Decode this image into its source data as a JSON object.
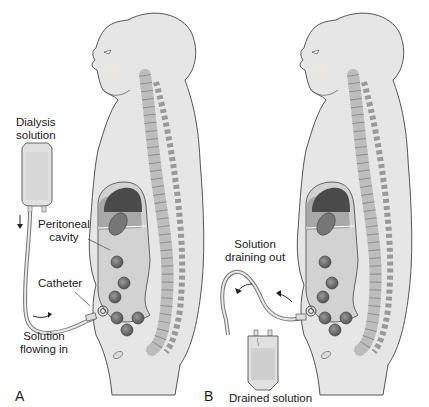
{
  "figure": {
    "panels": [
      {
        "id": "A",
        "letter": "A",
        "labels": {
          "bag": [
            "Dialysis",
            "solution"
          ],
          "cavity": [
            "Peritoneal",
            "cavity"
          ],
          "catheter": "Catheter",
          "flow": [
            "Solution",
            "flowing in"
          ]
        },
        "flow_direction": "into body"
      },
      {
        "id": "B",
        "letter": "B",
        "labels": {
          "flow": [
            "Solution",
            "draining out"
          ],
          "bag": "Drained solution"
        },
        "flow_direction": "out of body"
      }
    ]
  },
  "colors": {
    "skin": "#e6e6e6",
    "outline": "#555555",
    "cavity_shade": "#9a9a9a",
    "lung": "#4a4a4a",
    "spine": "#c8c8c8",
    "organ": "#6e6e6e",
    "bag_fill": "#d8d8d8"
  }
}
